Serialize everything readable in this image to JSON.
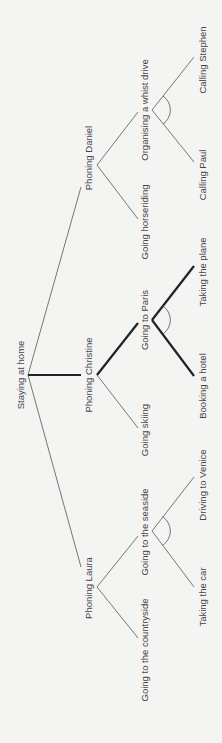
{
  "diagram": {
    "orientation": "rotated 90 degrees counter-clockwise",
    "root": {
      "label": "Staying at home"
    },
    "nodes": {
      "daniel": {
        "label": "Phoning Daniel"
      },
      "christine": {
        "label": "Phoning Christine"
      },
      "laura": {
        "label": "Phoning Laura"
      },
      "horseriding": {
        "label": "Going horseriding"
      },
      "whist": {
        "label": "Organising a whist drive"
      },
      "paul": {
        "label": "Calling Paul"
      },
      "stephen": {
        "label": "Calling Stephen"
      },
      "skiing": {
        "label": "Going skiing"
      },
      "paris": {
        "label": "Going to Paris"
      },
      "hotel": {
        "label": "Booking a hotel"
      },
      "plane": {
        "label": "Taking the plane"
      },
      "countryside": {
        "label": "Going to the countryside"
      },
      "seaside": {
        "label": "Going to the seaside"
      },
      "car": {
        "label": "Taking the car"
      },
      "venice": {
        "label": "Driving to Venice"
      }
    },
    "edges": [
      {
        "from": "root",
        "to": "daniel",
        "style": "thin"
      },
      {
        "from": "root",
        "to": "christine",
        "style": "thick"
      },
      {
        "from": "root",
        "to": "laura",
        "style": "thin"
      },
      {
        "from": "daniel",
        "to": "horseriding",
        "style": "thin"
      },
      {
        "from": "daniel",
        "to": "whist",
        "style": "thin"
      },
      {
        "from": "whist",
        "to": "paul",
        "style": "thin",
        "and_group": "whist"
      },
      {
        "from": "whist",
        "to": "stephen",
        "style": "thin",
        "and_group": "whist"
      },
      {
        "from": "christine",
        "to": "skiing",
        "style": "thin"
      },
      {
        "from": "christine",
        "to": "paris",
        "style": "thick"
      },
      {
        "from": "paris",
        "to": "hotel",
        "style": "thick",
        "and_group": "paris"
      },
      {
        "from": "paris",
        "to": "plane",
        "style": "thick",
        "and_group": "paris"
      },
      {
        "from": "laura",
        "to": "countryside",
        "style": "thin"
      },
      {
        "from": "laura",
        "to": "seaside",
        "style": "thin"
      },
      {
        "from": "seaside",
        "to": "car",
        "style": "thin",
        "and_group": "seaside"
      },
      {
        "from": "seaside",
        "to": "venice",
        "style": "thin",
        "and_group": "seaside"
      }
    ],
    "highlighted_path": [
      "Staying at home",
      "Phoning Christine",
      "Going to Paris",
      "Booking a hotel",
      "Taking the plane"
    ]
  }
}
